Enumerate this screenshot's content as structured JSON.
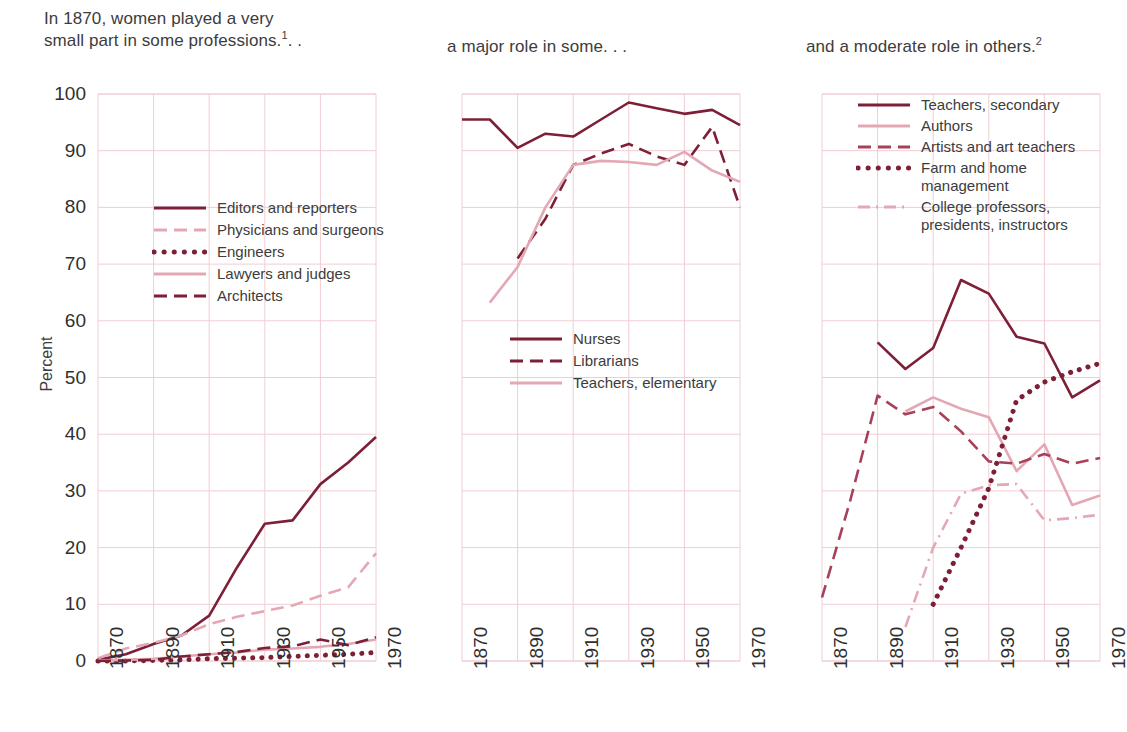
{
  "figure": {
    "ylabel": "Percent",
    "yticks": [
      0,
      10,
      20,
      30,
      40,
      50,
      60,
      70,
      80,
      90,
      100
    ],
    "xticks": [
      "1870",
      "1890",
      "1910",
      "1930",
      "1950",
      "1970"
    ],
    "colors": {
      "dark": "#7d1f36",
      "mid": "#a8405a",
      "light": "#e3a8b4",
      "grid": "#f0cdd4",
      "axis": "#d9a5b0"
    }
  },
  "panels": [
    {
      "title": "In 1870, women played a very\nsmall part in some professions.",
      "title_sup": "1",
      "title_suffix": ". .",
      "legend": [
        {
          "label": "Editors and reporters",
          "style": "solid",
          "color": "#7d1f36"
        },
        {
          "label": "Physicians and surgeons",
          "style": "dashed",
          "color": "#e3a8b4"
        },
        {
          "label": "Engineers",
          "style": "dotted",
          "color": "#7d1f36"
        },
        {
          "label": "Lawyers and judges",
          "style": "solid",
          "color": "#e3a8b4"
        },
        {
          "label": "Architects",
          "style": "dashed",
          "color": "#7d1f36"
        }
      ]
    },
    {
      "title": "a major role in some. . .",
      "title_sup": "",
      "title_suffix": "",
      "legend": [
        {
          "label": "Nurses",
          "style": "solid",
          "color": "#7d1f36"
        },
        {
          "label": "Librarians",
          "style": "dashed",
          "color": "#7d1f36"
        },
        {
          "label": "Teachers, elementary",
          "style": "solid",
          "color": "#e3a8b4"
        }
      ]
    },
    {
      "title": "and a moderate role in others.",
      "title_sup": "2",
      "title_suffix": "",
      "legend": [
        {
          "label": "Teachers, secondary",
          "style": "solid",
          "color": "#7d1f36"
        },
        {
          "label": "Authors",
          "style": "solid",
          "color": "#e3a8b4"
        },
        {
          "label": "Artists and art teachers",
          "style": "dashed",
          "color": "#a8405a"
        },
        {
          "label": "Farm and home\nmanagement",
          "style": "dotted",
          "color": "#7d1f36"
        },
        {
          "label": "College professors,\npresidents, instructors",
          "style": "dashdot",
          "color": "#e3a8b4"
        }
      ]
    }
  ],
  "chart_data": [
    {
      "type": "line",
      "title": "In 1870, women played a very small part in some professions.1 . .",
      "xlabel": "",
      "ylabel": "Percent",
      "xlim": [
        1870,
        1970
      ],
      "ylim": [
        0,
        100
      ],
      "grid": true,
      "legend_position": "inside-left",
      "x": [
        1870,
        1880,
        1890,
        1900,
        1910,
        1920,
        1930,
        1940,
        1950,
        1960,
        1970
      ],
      "series": [
        {
          "name": "Editors and reporters",
          "values": [
            0.2,
            1.2,
            3.0,
            4.5,
            8.0,
            16.5,
            24.2,
            24.8,
            31.2,
            35.0,
            39.5
          ]
        },
        {
          "name": "Physicians and surgeons",
          "values": [
            0.5,
            2.2,
            3.2,
            4.5,
            6.5,
            7.8,
            8.8,
            9.8,
            11.5,
            13.0,
            19.0
          ]
        },
        {
          "name": "Engineers",
          "values": [
            0.0,
            0.0,
            0.1,
            0.2,
            0.4,
            0.5,
            0.6,
            0.8,
            1.0,
            1.2,
            1.5
          ]
        },
        {
          "name": "Lawyers and judges",
          "values": [
            0.1,
            0.2,
            0.4,
            0.8,
            1.2,
            1.5,
            2.0,
            2.2,
            2.5,
            3.0,
            3.8
          ]
        },
        {
          "name": "Architects",
          "values": [
            0.0,
            0.1,
            0.2,
            0.8,
            1.2,
            1.6,
            2.3,
            2.6,
            3.8,
            2.8,
            4.2
          ]
        }
      ]
    },
    {
      "type": "line",
      "title": "a major role in some. . .",
      "xlabel": "",
      "ylabel": "Percent",
      "xlim": [
        1870,
        1970
      ],
      "ylim": [
        0,
        100
      ],
      "grid": true,
      "legend_position": "inside-left",
      "x": [
        1870,
        1880,
        1890,
        1900,
        1910,
        1920,
        1930,
        1940,
        1950,
        1960,
        1970
      ],
      "series": [
        {
          "name": "Nurses",
          "values": [
            95.5,
            95.5,
            90.5,
            93.0,
            92.5,
            95.5,
            98.5,
            97.5,
            96.5,
            97.2,
            94.5
          ]
        },
        {
          "name": "Librarians",
          "values": [
            null,
            null,
            71.0,
            78.0,
            87.5,
            89.5,
            91.2,
            89.0,
            87.5,
            94.2,
            80.0
          ]
        },
        {
          "name": "Teachers, elementary",
          "values": [
            null,
            63.2,
            69.5,
            80.0,
            87.5,
            88.2,
            88.0,
            87.5,
            89.8,
            86.5,
            84.5
          ]
        }
      ]
    },
    {
      "type": "line",
      "title": "and a moderate role in others.2",
      "xlabel": "",
      "ylabel": "Percent",
      "xlim": [
        1870,
        1970
      ],
      "ylim": [
        0,
        100
      ],
      "grid": true,
      "legend_position": "inside-top",
      "x": [
        1870,
        1880,
        1890,
        1900,
        1910,
        1920,
        1930,
        1940,
        1950,
        1960,
        1970
      ],
      "series": [
        {
          "name": "Teachers, secondary",
          "values": [
            null,
            null,
            56.2,
            51.5,
            55.2,
            67.2,
            64.8,
            57.2,
            56.0,
            46.5,
            49.5
          ]
        },
        {
          "name": "Authors",
          "values": [
            null,
            null,
            null,
            44.0,
            46.5,
            44.5,
            43.0,
            33.5,
            38.2,
            27.5,
            29.2
          ]
        },
        {
          "name": "Artists and art teachers",
          "values": [
            11.2,
            28.0,
            46.8,
            43.5,
            44.8,
            40.5,
            35.2,
            34.8,
            36.5,
            34.8,
            35.8
          ]
        },
        {
          "name": "Farm and home management",
          "values": [
            null,
            null,
            null,
            null,
            10.0,
            20.0,
            30.5,
            46.0,
            49.2,
            51.0,
            52.5
          ]
        },
        {
          "name": "College professors, presidents, instructors",
          "values": [
            null,
            null,
            null,
            6.0,
            20.0,
            29.5,
            31.0,
            31.2,
            24.8,
            25.2,
            25.8
          ]
        }
      ]
    }
  ]
}
